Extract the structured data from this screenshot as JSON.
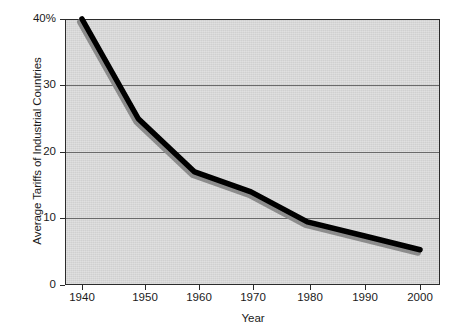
{
  "chart_data": {
    "type": "line",
    "title": "",
    "xlabel": "Year",
    "ylabel": "Average Tariffs of Industrial Countries",
    "x": [
      1940,
      1950,
      1960,
      1970,
      1980,
      1990,
      2000
    ],
    "values": [
      40,
      25,
      17,
      14,
      9.5,
      7.4,
      5.3
    ],
    "series": [
      {
        "name": "Average Tariffs of Industrial Countries",
        "values": [
          40,
          25,
          17,
          14,
          9.5,
          7.4,
          5.3
        ],
        "color": "#000000",
        "shadow_color": "#8c8c8c"
      }
    ],
    "xlim": [
      1937,
      2003
    ],
    "ylim": [
      0,
      40
    ],
    "x_tick_labels": [
      "1940",
      "1950",
      "1960",
      "1970",
      "1980",
      "1990",
      "2000"
    ],
    "y_tick_labels": [
      "0",
      "10",
      "20",
      "30",
      "40%"
    ],
    "y_tick_values": [
      0,
      10,
      20,
      30,
      40
    ],
    "grid": "horizontal",
    "legend": "none",
    "plot_background": "#d9d9d9",
    "page_background": "#ffffff",
    "axis_color": "#2b2b2b",
    "gridline_color": "#6a6a6a"
  }
}
